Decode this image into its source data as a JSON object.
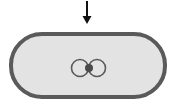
{
  "diagram": {
    "arrow": {
      "direction": "down",
      "color": "#111111"
    },
    "pill": {
      "fill": "#e3e3e3",
      "stroke": "#5a5a5a"
    },
    "icon": {
      "name": "overlapping-circles-icon",
      "ring_color": "#5a5a5a",
      "dot_color": "#4a4a4a"
    }
  }
}
